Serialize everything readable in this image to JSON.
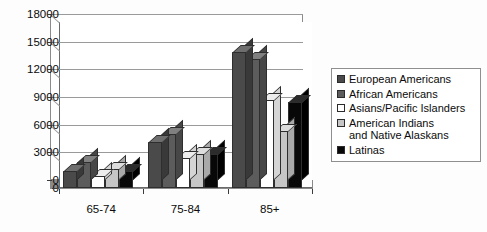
{
  "chart_data": {
    "type": "bar",
    "title": "",
    "subtitle": "",
    "xlabel": "",
    "ylabel": "",
    "categories": [
      "65-74",
      "75-84",
      "85+"
    ],
    "ylim": [
      0,
      18000
    ],
    "yticks": [
      0,
      3000,
      6000,
      9000,
      12000,
      15000,
      18000
    ],
    "ytick_labels": [
      "0",
      "3000",
      "6000",
      "9000",
      "12000",
      "15000",
      "18000"
    ],
    "grid": true,
    "legend_position": "right",
    "style": "3d-clustered-column",
    "series": [
      {
        "name": "European Americans",
        "color": "#4a4a4a",
        "top_color": "#6e6e6e",
        "side_color": "#393939",
        "values": [
          1800,
          5000,
          14800
        ]
      },
      {
        "name": "African Americans",
        "color": "#5c5c5c",
        "top_color": "#808080",
        "side_color": "#474747",
        "values": [
          2800,
          5900,
          14000
        ]
      },
      {
        "name": "Asians/Pacific Islanders",
        "color": "#ffffff",
        "top_color": "#ededed",
        "side_color": "#d5d5d5",
        "values": [
          1300,
          3300,
          9500
        ]
      },
      {
        "name": "American Indians\nand Native Alaskans",
        "color": "#c6c6c6",
        "top_color": "#dddddd",
        "side_color": "#a9a9a9",
        "values": [
          2100,
          3700,
          6200
        ]
      },
      {
        "name": "Latinas",
        "color": "#080808",
        "top_color": "#2c2c2c",
        "side_color": "#000000",
        "values": [
          1800,
          3700,
          9300
        ]
      }
    ]
  },
  "legend": {
    "items": [
      {
        "label": "European Americans",
        "swatch": "#4a4a4a"
      },
      {
        "label": "African Americans",
        "swatch": "#5c5c5c"
      },
      {
        "label": "Asians/Pacific Islanders",
        "swatch": "#ffffff"
      },
      {
        "label": "American Indians\nand Native Alaskans",
        "swatch": "#c6c6c6"
      },
      {
        "label": "Latinas",
        "swatch": "#080808"
      }
    ]
  },
  "colors": {
    "axis": "#3b3b3b",
    "gridline": "#8d8d8d",
    "plot_background": "#ffffff",
    "page_background": "#fdfdfd",
    "legend_border": "#8f8f8f",
    "text": "#0b0b0b"
  }
}
